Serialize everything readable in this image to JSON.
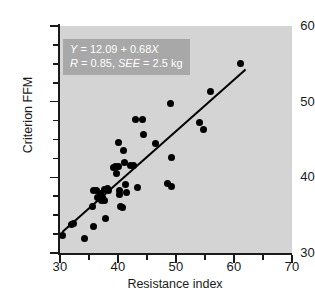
{
  "chart_data": {
    "type": "scatter",
    "title": "",
    "xlabel": "Resistance index",
    "ylabel": "Criterion FFM",
    "xlim": [
      30,
      70
    ],
    "ylim": [
      30,
      60
    ],
    "xticks": [
      30,
      40,
      50,
      60,
      70
    ],
    "xticks_minor": [
      35,
      45,
      55,
      65
    ],
    "yticks": [
      30,
      40,
      50,
      60
    ],
    "yticks_minor": [
      32.5,
      35,
      37.5,
      42.5,
      45,
      47.5,
      52.5,
      55,
      57.5
    ],
    "grid": false,
    "legend": "none",
    "plot_background": "#d4d4d4",
    "marker_color": "#000000",
    "line_color": "#000000",
    "annotation": {
      "background": "#a8a8a8",
      "text_color": "#ffffff",
      "line1_prefix": "Y",
      "line1_body": " = 12.09 + 0.68",
      "line1_suffix": "X",
      "line2_prefix": "R",
      "line2_mid": " = 0.85, ",
      "line2_stat": "SEE",
      "line2_tail": " = 2.5 kg",
      "full_text": "Y = 12.09 + 0.68X; R = 0.85, SEE = 2.5 kg"
    },
    "fit": {
      "intercept": 12.09,
      "slope": 0.68,
      "r": 0.85,
      "see": 2.5,
      "see_units": "kg",
      "x_start": 30.4,
      "x_end": 62.0
    },
    "points": [
      [
        30.4,
        32.3
      ],
      [
        32.0,
        33.8
      ],
      [
        32.4,
        33.9
      ],
      [
        34.2,
        31.9
      ],
      [
        35.7,
        33.5
      ],
      [
        35.6,
        36.1
      ],
      [
        35.8,
        38.3
      ],
      [
        36.3,
        38.3
      ],
      [
        36.5,
        37.4
      ],
      [
        36.9,
        37.2
      ],
      [
        37.0,
        37.8
      ],
      [
        37.2,
        36.9
      ],
      [
        37.3,
        37.3
      ],
      [
        37.6,
        36.9
      ],
      [
        37.7,
        38.4
      ],
      [
        37.9,
        34.6
      ],
      [
        38.2,
        38.5
      ],
      [
        38.4,
        38.3
      ],
      [
        39.3,
        41.3
      ],
      [
        39.6,
        41.4
      ],
      [
        39.8,
        40.5
      ],
      [
        40.0,
        41.4
      ],
      [
        40.1,
        44.6
      ],
      [
        40.2,
        38.3
      ],
      [
        40.3,
        37.7
      ],
      [
        40.4,
        36.1
      ],
      [
        40.7,
        36.0
      ],
      [
        41.0,
        43.6
      ],
      [
        41.2,
        42.0
      ],
      [
        41.3,
        39.0
      ],
      [
        41.5,
        38.0
      ],
      [
        42.2,
        41.6
      ],
      [
        42.6,
        41.5
      ],
      [
        43.0,
        47.6
      ],
      [
        43.3,
        38.6
      ],
      [
        44.3,
        47.6
      ],
      [
        44.4,
        45.6
      ],
      [
        46.5,
        44.5
      ],
      [
        48.5,
        39.2
      ],
      [
        49.1,
        49.7
      ],
      [
        49.2,
        42.6
      ],
      [
        49.3,
        38.8
      ],
      [
        54.0,
        47.2
      ],
      [
        54.8,
        46.3
      ],
      [
        56.0,
        51.3
      ],
      [
        61.2,
        55.0
      ]
    ]
  }
}
